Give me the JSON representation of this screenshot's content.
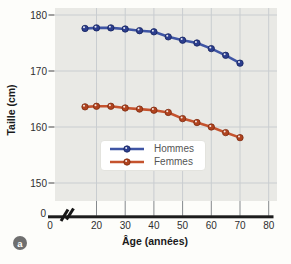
{
  "figure": {
    "panel_label": "a"
  },
  "colors": {
    "plot_bg": "#e9e9e5",
    "gridline": "#c9cdd0",
    "tick_line": "#85898d",
    "axis": "#1d1d1d",
    "tick_text": "#2f2f2f",
    "legend_text": "#555555",
    "badge_bg": "#6f6f6f"
  },
  "chart_data": {
    "type": "line",
    "title": "",
    "xlabel": "Âge (années)",
    "ylabel": "Taille (cm)",
    "x_ticks": [
      0,
      20,
      30,
      40,
      50,
      60,
      70,
      80
    ],
    "y_ticks": [
      0,
      150,
      160,
      170,
      180
    ],
    "x_axis_break_between": [
      0,
      20
    ],
    "grid": true,
    "legend_position": "inside-bottom-center",
    "x": [
      16,
      20,
      25,
      30,
      35,
      40,
      45,
      50,
      55,
      60,
      65,
      70
    ],
    "series": [
      {
        "name": "Hommes",
        "color": "#3f55a4",
        "marker_color": "#2c3e8e",
        "marker_stroke": "#16245f",
        "values": [
          177.6,
          177.7,
          177.7,
          177.5,
          177.2,
          177.0,
          176.1,
          175.5,
          175.0,
          174.0,
          172.8,
          171.4
        ]
      },
      {
        "name": "Femmes",
        "color": "#c5532e",
        "marker_color": "#b0431f",
        "marker_stroke": "#7e2c10",
        "values": [
          163.6,
          163.7,
          163.7,
          163.4,
          163.2,
          163.0,
          162.6,
          161.5,
          160.8,
          160.0,
          159.0,
          158.1
        ]
      }
    ]
  }
}
